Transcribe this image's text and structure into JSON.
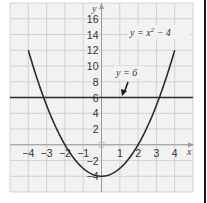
{
  "chart_data": {
    "type": "line",
    "title": "",
    "xlabel": "x",
    "ylabel": "y",
    "xlim": [
      -5,
      5
    ],
    "ylim": [
      -6,
      18
    ],
    "grid": true,
    "x_ticks": [
      "-4",
      "-3",
      "-2",
      "-1",
      "1",
      "2",
      "3",
      "4"
    ],
    "y_ticks": [
      "16",
      "14",
      "12",
      "10",
      "8",
      "6",
      "4",
      "2",
      "-2",
      "-4"
    ],
    "series": [
      {
        "name": "y = x² − 4",
        "function": "x^2 - 4",
        "x": [
          -4,
          -3,
          -2,
          -1,
          0,
          1,
          2,
          3,
          4
        ],
        "values": [
          12,
          5,
          0,
          -3,
          -4,
          -3,
          0,
          5,
          12
        ],
        "color": "#2b2b2b"
      },
      {
        "name": "y = 6",
        "function": "6",
        "x": [
          -5,
          5
        ],
        "values": [
          6,
          6
        ],
        "color": "#2b2b2b"
      }
    ],
    "annotations": [
      {
        "text": "y = x² − 4",
        "x": 2.9,
        "y": 14
      },
      {
        "text": "y = 6",
        "x": 1.0,
        "y": 8.5,
        "arrow_to": [
          0.7,
          6
        ]
      }
    ],
    "intersections": [
      [
        -3.16,
        6
      ],
      [
        3.16,
        6
      ]
    ]
  },
  "labels": {
    "x_axis": "x",
    "y_axis": "y",
    "curve_label_main": "y = x",
    "curve_label_sup": "2",
    "curve_label_tail": " − 4",
    "line_label": "y = 6"
  },
  "colors": {
    "background": "#f2f2f2",
    "grid": "#c9c9c9",
    "axis": "#9a9a9a",
    "curve": "#2b2b2b"
  }
}
